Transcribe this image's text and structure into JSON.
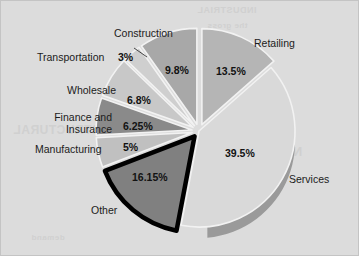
{
  "figure": {
    "background_color": "#dcdcdc",
    "border_color": "#c4c4c4",
    "bleed_through": [
      "INDUSTRIAL",
      "the gross",
      "NATURAL",
      "financing",
      "demand",
      "STRUCTURAL"
    ]
  },
  "chart_data": {
    "type": "pie",
    "title": "",
    "subtitle": "",
    "xlabel": "",
    "ylabel": "",
    "legend_position": "none",
    "grid": false,
    "units": "percent",
    "total": 100,
    "start_angle_deg": 0,
    "direction": "clockwise",
    "categories": [
      "Retailing",
      "Services",
      "Other",
      "Manufacturing",
      "Finance and Insurance",
      "Wholesale",
      "Transportation",
      "Construction"
    ],
    "values": [
      13.5,
      39.5,
      16.15,
      5,
      6.25,
      6.8,
      3,
      9.8
    ],
    "value_labels": [
      "13.5%",
      "39.5%",
      "16.15%",
      "5%",
      "6.25%",
      "6.8%",
      "3%",
      "9.8%"
    ],
    "colors": [
      "#b5b5b5",
      "#d9d9d9",
      "#808080",
      "#c0c0c0",
      "#8a8a8a",
      "#c8c8c8",
      "#cfcfcf",
      "#a8a8a8"
    ],
    "slices": [
      {
        "name": "Retailing",
        "label": "Retailing",
        "value": 13.5,
        "value_label": "13.5%",
        "color": "#b5b5b5",
        "label_x": 253,
        "label_y": 36,
        "pct_x": 215,
        "pct_y": 64,
        "align": "left"
      },
      {
        "name": "Services",
        "label": "Services",
        "value": 39.5,
        "value_label": "39.5%",
        "color": "#d9d9d9",
        "label_x": 288,
        "label_y": 172,
        "pct_x": 224,
        "pct_y": 146,
        "align": "left"
      },
      {
        "name": "Other",
        "label": "Other",
        "value": 16.15,
        "value_label": "16.15%",
        "color": "#808080",
        "label_x": 90,
        "label_y": 203,
        "pct_x": 131,
        "pct_y": 170,
        "align": "left"
      },
      {
        "name": "Manufacturing",
        "label": "Manufacturing",
        "value": 5,
        "value_label": "5%",
        "color": "#c0c0c0",
        "label_x": 34,
        "label_y": 142,
        "pct_x": 122,
        "pct_y": 140,
        "align": "left"
      },
      {
        "name": "Finance and Insurance",
        "label": "Finance and\nInsurance",
        "value": 6.25,
        "value_label": "6.25%",
        "color": "#8a8a8a",
        "label_x": 45,
        "label_y": 110,
        "pct_x": 122,
        "pct_y": 119,
        "align": "right"
      },
      {
        "name": "Wholesale",
        "label": "Wholesale",
        "value": 6.8,
        "value_label": "6.8%",
        "color": "#c8c8c8",
        "label_x": 66,
        "label_y": 83,
        "pct_x": 126,
        "pct_y": 93,
        "align": "left"
      },
      {
        "name": "Transportation",
        "label": "Transportation",
        "value": 3,
        "value_label": "3%",
        "color": "#cfcfcf",
        "label_x": 36,
        "label_y": 50,
        "pct_x": 117,
        "pct_y": 50,
        "align": "left"
      },
      {
        "name": "Construction",
        "label": "Construction",
        "value": 9.8,
        "value_label": "9.8%",
        "color": "#a8a8a8",
        "label_x": 113,
        "label_y": 26,
        "pct_x": 164,
        "pct_y": 63,
        "align": "left"
      }
    ]
  }
}
